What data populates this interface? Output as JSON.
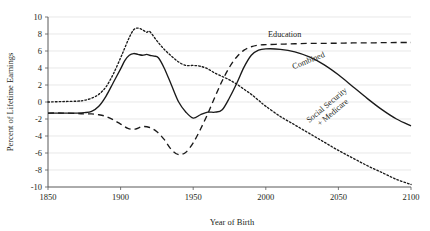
{
  "chart_data": {
    "type": "line",
    "title": "",
    "xlabel": "Year of Birth",
    "ylabel": "Percent of Lifetime Earnings",
    "xlim": [
      1850,
      2100
    ],
    "ylim": [
      -10,
      10
    ],
    "xticks": [
      1850,
      1900,
      1950,
      2000,
      2050,
      2100
    ],
    "xtick_labels": [
      "1850",
      "1900",
      "1950",
      "2000",
      "2050",
      "2100"
    ],
    "yticks": [
      -10,
      -8,
      -6,
      -4,
      -2,
      0,
      2,
      4,
      6,
      8,
      10
    ],
    "ytick_labels": [
      "-10",
      "-8",
      "-6",
      "-4",
      "-2",
      "0",
      "2",
      "4",
      "6",
      "8",
      "10"
    ],
    "grid": "horizontal",
    "legend_position": "inline-annotations",
    "series": [
      {
        "name": "Education",
        "style": "dashed",
        "label_x": 2013,
        "label_y": 7.7,
        "label_rotation": 0,
        "x": [
          1850,
          1860,
          1870,
          1875,
          1880,
          1885,
          1890,
          1895,
          1900,
          1905,
          1910,
          1915,
          1920,
          1925,
          1930,
          1935,
          1940,
          1945,
          1950,
          1955,
          1960,
          1965,
          1970,
          1975,
          1980,
          1985,
          1990,
          1995,
          2000,
          2010,
          2020,
          2030,
          2040,
          2050,
          2060,
          2070,
          2080,
          2090,
          2100
        ],
        "y": [
          -1.3,
          -1.3,
          -1.35,
          -1.4,
          -1.4,
          -1.5,
          -1.7,
          -2.1,
          -2.6,
          -3.1,
          -3.2,
          -2.9,
          -3.0,
          -3.5,
          -4.4,
          -5.6,
          -6.2,
          -5.9,
          -4.8,
          -3.2,
          -1.4,
          0.6,
          2.5,
          4.1,
          5.3,
          6.1,
          6.5,
          6.7,
          6.75,
          6.8,
          6.85,
          6.9,
          6.9,
          6.92,
          6.95,
          6.95,
          6.98,
          7.0,
          7.0
        ]
      },
      {
        "name": "Combined",
        "style": "solid",
        "label_x": 2030,
        "label_y": 4.6,
        "label_rotation": -22,
        "x": [
          1850,
          1860,
          1865,
          1870,
          1875,
          1880,
          1885,
          1890,
          1895,
          1900,
          1903,
          1906,
          1909,
          1912,
          1915,
          1918,
          1920,
          1923,
          1926,
          1930,
          1935,
          1940,
          1945,
          1950,
          1955,
          1960,
          1965,
          1970,
          1975,
          1980,
          1985,
          1990,
          1995,
          2000,
          2010,
          2020,
          2030,
          2040,
          2050,
          2060,
          2070,
          2080,
          2090,
          2100
        ],
        "y": [
          -1.3,
          -1.3,
          -1.3,
          -1.3,
          -1.25,
          -1.1,
          -0.5,
          0.7,
          2.3,
          3.9,
          4.9,
          5.5,
          5.7,
          5.6,
          5.5,
          5.6,
          5.5,
          5.4,
          5.2,
          4.0,
          2.0,
          0.0,
          -1.2,
          -1.9,
          -1.5,
          -1.2,
          -1.2,
          -0.9,
          0.5,
          2.2,
          4.1,
          5.5,
          6.1,
          6.25,
          6.2,
          5.9,
          5.3,
          4.4,
          3.2,
          1.8,
          0.4,
          -0.9,
          -2.0,
          -2.8
        ]
      },
      {
        "name": "Social Security + Medicare",
        "style": "dotted",
        "label_x": 2043,
        "label_y": -0.6,
        "label_rotation": -40,
        "x": [
          1850,
          1860,
          1870,
          1875,
          1880,
          1885,
          1890,
          1895,
          1900,
          1903,
          1906,
          1909,
          1912,
          1915,
          1918,
          1920,
          1925,
          1930,
          1935,
          1940,
          1945,
          1950,
          1955,
          1960,
          1965,
          1970,
          1975,
          1980,
          1985,
          1990,
          1995,
          2000,
          2010,
          2020,
          2030,
          2040,
          2050,
          2060,
          2070,
          2080,
          2090,
          2100
        ],
        "y": [
          0.0,
          0.05,
          0.1,
          0.2,
          0.45,
          0.9,
          1.8,
          3.3,
          5.2,
          6.4,
          7.6,
          8.5,
          8.7,
          8.5,
          8.2,
          8.3,
          7.2,
          6.2,
          5.4,
          4.7,
          4.3,
          4.3,
          4.2,
          3.9,
          3.4,
          3.0,
          2.6,
          2.1,
          1.5,
          0.9,
          0.2,
          -0.5,
          -1.7,
          -2.7,
          -3.7,
          -4.7,
          -5.7,
          -6.6,
          -7.5,
          -8.3,
          -9.1,
          -9.7
        ]
      }
    ]
  },
  "axes": {
    "y_axis_title": "Percent of Lifetime Earnings",
    "x_axis_title": "Year of Birth"
  }
}
